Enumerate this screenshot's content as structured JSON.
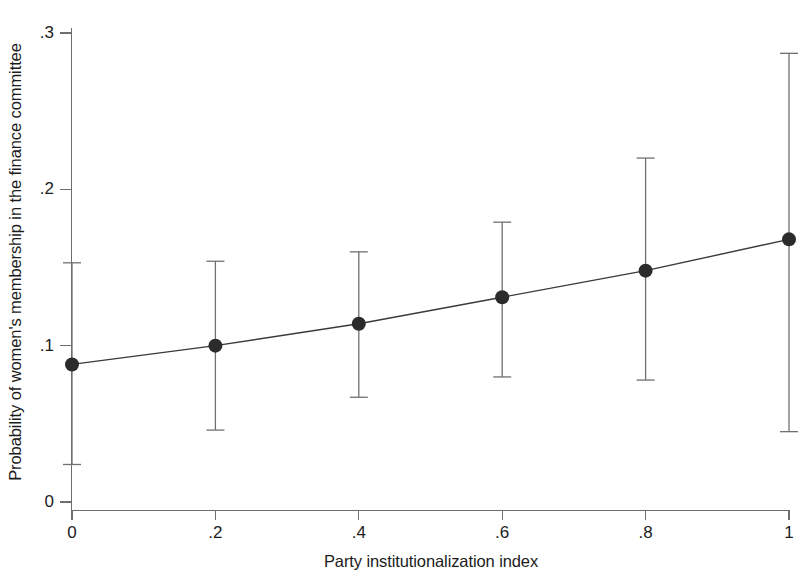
{
  "chart_data": {
    "type": "line",
    "title": "",
    "subtitle": "",
    "xlabel": "Party institutionalization index",
    "ylabel": "Probability of women's membership in the finance committee",
    "x": [
      0,
      0.2,
      0.4,
      0.6,
      0.8,
      1
    ],
    "values": [
      0.088,
      0.1,
      0.114,
      0.131,
      0.148,
      0.168
    ],
    "error_bars": {
      "type": "confidence-interval",
      "lower": [
        0.024,
        0.046,
        0.067,
        0.08,
        0.078,
        0.045
      ],
      "upper": [
        0.153,
        0.154,
        0.16,
        0.179,
        0.22,
        0.287
      ]
    },
    "series": [
      {
        "name": "Predicted probability",
        "values": [
          0.088,
          0.1,
          0.114,
          0.131,
          0.148,
          0.168
        ]
      }
    ],
    "xlim": [
      0,
      1
    ],
    "ylim": [
      0,
      0.3
    ],
    "xticks": [
      0,
      0.2,
      0.4,
      0.6,
      0.8,
      1
    ],
    "xtick_labels": [
      "0",
      ".2",
      ".4",
      ".6",
      ".8",
      "1"
    ],
    "yticks": [
      0,
      0.1,
      0.2,
      0.3
    ],
    "ytick_labels": [
      "0",
      ".1",
      ".2",
      ".3"
    ],
    "grid": false,
    "legend": null,
    "marker": "filled-circle",
    "colors": {
      "line": "#3a3a3a",
      "marker": "#2b2b2b",
      "error_bar": "#707070",
      "axis": "#6e6e6e",
      "text": "#1c1c1c",
      "background": "#ffffff"
    }
  }
}
